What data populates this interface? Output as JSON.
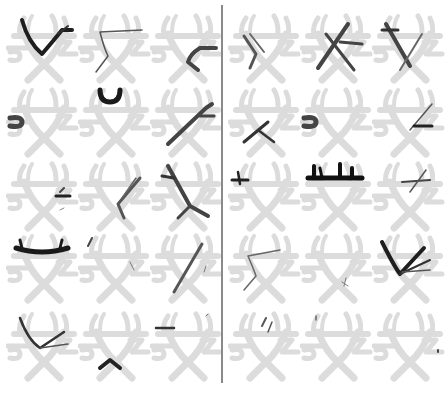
{
  "figure": {
    "layout": {
      "rows": 5,
      "cols_per_panel": 3,
      "panels": 2
    },
    "colors": {
      "template": "#dcdcdc",
      "tract_dark": "#1e1e1e",
      "tract_mid": "#4a4a4a",
      "divider": "#8a8a8a",
      "background": "#ffffff"
    },
    "panels": [
      {
        "name": "left",
        "cells": [
          {
            "row": 0,
            "col": 0,
            "tract": "v-shape-full",
            "shade": "dark"
          },
          {
            "row": 0,
            "col": 1,
            "tract": "thin-left-arc",
            "shade": "mid"
          },
          {
            "row": 0,
            "col": 2,
            "tract": "right-branch",
            "shade": "mid"
          },
          {
            "row": 1,
            "col": 0,
            "tract": "left-hook",
            "shade": "mid"
          },
          {
            "row": 1,
            "col": 1,
            "tract": "top-u",
            "shade": "dark"
          },
          {
            "row": 1,
            "col": 2,
            "tract": "right-diagonal",
            "shade": "mid"
          },
          {
            "row": 2,
            "col": 0,
            "tract": "small-right-fragment",
            "shade": "dark"
          },
          {
            "row": 2,
            "col": 1,
            "tract": "right-fan-down",
            "shade": "mid"
          },
          {
            "row": 2,
            "col": 2,
            "tract": "left-cross",
            "shade": "mid"
          },
          {
            "row": 3,
            "col": 0,
            "tract": "top-bar-wide",
            "shade": "dark"
          },
          {
            "row": 3,
            "col": 1,
            "tract": "sparse-fragments",
            "shade": "mid"
          },
          {
            "row": 3,
            "col": 2,
            "tract": "right-long-diagonal",
            "shade": "mid"
          },
          {
            "row": 4,
            "col": 0,
            "tract": "v-shape-thin",
            "shade": "mid"
          },
          {
            "row": 4,
            "col": 1,
            "tract": "bottom-chevron",
            "shade": "dark"
          },
          {
            "row": 4,
            "col": 2,
            "tract": "top-short-bar",
            "shade": "mid"
          }
        ]
      },
      {
        "name": "right",
        "cells": [
          {
            "row": 0,
            "col": 0,
            "tract": "left-fan-down",
            "shade": "mid"
          },
          {
            "row": 0,
            "col": 1,
            "tract": "cross-branch",
            "shade": "mid"
          },
          {
            "row": 0,
            "col": 2,
            "tract": "left-cross",
            "shade": "mid"
          },
          {
            "row": 1,
            "col": 0,
            "tract": "bottom-cross",
            "shade": "dark"
          },
          {
            "row": 1,
            "col": 1,
            "tract": "left-hook",
            "shade": "mid"
          },
          {
            "row": 1,
            "col": 2,
            "tract": "right-thin-fan",
            "shade": "mid"
          },
          {
            "row": 2,
            "col": 0,
            "tract": "top-left-fragment",
            "shade": "dark"
          },
          {
            "row": 2,
            "col": 1,
            "tract": "top-bar-comb",
            "shade": "dark"
          },
          {
            "row": 2,
            "col": 2,
            "tract": "right-thin-cross",
            "shade": "mid"
          },
          {
            "row": 3,
            "col": 0,
            "tract": "thin-left-arc",
            "shade": "mid"
          },
          {
            "row": 3,
            "col": 1,
            "tract": "tiny-fragment",
            "shade": "mid"
          },
          {
            "row": 3,
            "col": 2,
            "tract": "v-shape-full",
            "shade": "dark"
          },
          {
            "row": 4,
            "col": 0,
            "tract": "small-top-curl",
            "shade": "mid"
          },
          {
            "row": 4,
            "col": 1,
            "tract": "tiny-top-dot",
            "shade": "mid"
          },
          {
            "row": 4,
            "col": 2,
            "tract": "tiny-right-dot",
            "shade": "mid"
          }
        ]
      }
    ]
  }
}
